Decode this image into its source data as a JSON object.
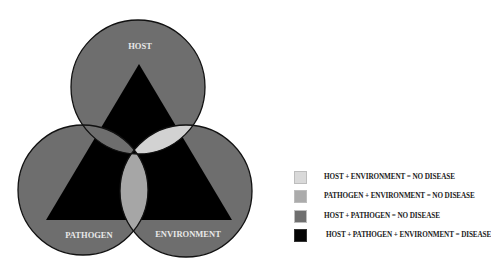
{
  "diagram": {
    "circles": [
      {
        "id": "host",
        "label": "HOST",
        "cx": 138,
        "cy": 87,
        "r": 67
      },
      {
        "id": "pathogen",
        "label": "PATHOGEN",
        "cx": 83,
        "cy": 190,
        "r": 65
      },
      {
        "id": "environment",
        "label": "ENVIRONMENT",
        "cx": 186,
        "cy": 191,
        "r": 66
      }
    ],
    "triangle": {
      "points": "139,64 46,220 232,220",
      "color": "#000000"
    },
    "colors": {
      "circle_fill": "#6e6e6e",
      "outline": "#111111",
      "host_environment": "#d2d2d2",
      "pathogen_environment": "#a6a6a6",
      "host_pathogen": "#6e6e6e",
      "all_three": "#000000",
      "label_text": "#e8e8e8"
    }
  },
  "legend": {
    "items": [
      {
        "label": "HOST + ENVIRONMENT = NO DISEASE",
        "color": "#d9d9d9"
      },
      {
        "label": "PATHOGEN + ENVIRONMENT = NO DISEASE",
        "color": "#ababab"
      },
      {
        "label": "HOST + PATHOGEN = NO DISEASE",
        "color": "#6f6f6f"
      },
      {
        "label": "HOST + PATHOGEN + ENVIRONMENT = DISEASE",
        "color": "#050505"
      }
    ]
  }
}
